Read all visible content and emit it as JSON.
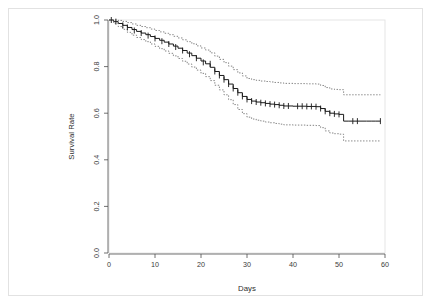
{
  "figure": {
    "kind": "kaplan-meier-survival-plot",
    "background_color": "#ffffff",
    "frame_color": "#e2e2e2",
    "axis_color": "#4d4d4d",
    "curve_color": "#1a1a1a",
    "ci_color": "#6e6e6e"
  },
  "chart_data": {
    "type": "line",
    "title": "",
    "subtitle": "",
    "xlabel": "Days",
    "ylabel": "Survival Rate",
    "xlim": [
      0,
      60
    ],
    "ylim": [
      0.0,
      1.0
    ],
    "xticks": [
      0,
      10,
      20,
      30,
      40,
      50,
      60
    ],
    "xtick_labels": [
      "0",
      "10",
      "20",
      "30",
      "40",
      "50",
      "60"
    ],
    "yticks": [
      0.0,
      0.2,
      0.4,
      0.6,
      0.8,
      1.0
    ],
    "ytick_labels": [
      "0.0",
      "0.2",
      "0.4",
      "0.6",
      "0.8",
      "1.0"
    ],
    "grid": false,
    "legend": "none",
    "step_style": "post",
    "annotations": [],
    "series": [
      {
        "name": "Survival estimate",
        "style": "solid",
        "color": "#1a1a1a",
        "x": [
          0,
          1,
          2,
          3,
          4,
          5,
          6,
          7,
          8,
          9,
          10,
          11,
          12,
          13,
          14,
          15,
          16,
          17,
          18,
          19,
          20,
          21,
          22,
          23,
          24,
          25,
          26,
          27,
          28,
          29,
          30,
          31,
          32,
          33,
          34,
          35,
          36,
          37,
          38,
          39,
          40,
          41,
          42,
          43,
          44,
          45,
          46,
          47,
          48,
          49,
          50,
          51,
          52,
          53,
          54,
          55,
          56,
          57,
          58,
          59
        ],
        "values": [
          1.0,
          0.993,
          0.985,
          0.977,
          0.968,
          0.959,
          0.951,
          0.944,
          0.937,
          0.929,
          0.921,
          0.913,
          0.905,
          0.897,
          0.888,
          0.879,
          0.869,
          0.858,
          0.847,
          0.836,
          0.824,
          0.812,
          0.797,
          0.779,
          0.762,
          0.744,
          0.725,
          0.706,
          0.688,
          0.672,
          0.659,
          0.652,
          0.648,
          0.645,
          0.642,
          0.639,
          0.637,
          0.634,
          0.631,
          0.631,
          0.63,
          0.63,
          0.63,
          0.629,
          0.629,
          0.628,
          0.62,
          0.608,
          0.6,
          0.597,
          0.595,
          0.566,
          0.566,
          0.566,
          0.566,
          0.566,
          0.566,
          0.566,
          0.566,
          0.566
        ]
      },
      {
        "name": "Upper 95% confidence limit",
        "style": "dotted",
        "color": "#6e6e6e",
        "x": [
          0,
          1,
          2,
          3,
          4,
          5,
          6,
          7,
          8,
          9,
          10,
          11,
          12,
          13,
          14,
          15,
          16,
          17,
          18,
          19,
          20,
          21,
          22,
          23,
          24,
          25,
          26,
          27,
          28,
          29,
          30,
          31,
          32,
          33,
          34,
          35,
          36,
          37,
          38,
          39,
          40,
          41,
          42,
          43,
          44,
          45,
          46,
          47,
          48,
          49,
          50,
          51,
          52,
          53,
          54,
          55,
          56,
          57,
          58,
          59
        ],
        "values": [
          1.0,
          1.0,
          0.998,
          0.994,
          0.989,
          0.983,
          0.977,
          0.972,
          0.967,
          0.961,
          0.955,
          0.949,
          0.943,
          0.937,
          0.93,
          0.923,
          0.915,
          0.907,
          0.898,
          0.889,
          0.88,
          0.871,
          0.859,
          0.845,
          0.831,
          0.817,
          0.802,
          0.787,
          0.773,
          0.76,
          0.749,
          0.744,
          0.741,
          0.738,
          0.736,
          0.734,
          0.732,
          0.73,
          0.728,
          0.728,
          0.727,
          0.727,
          0.727,
          0.726,
          0.726,
          0.725,
          0.719,
          0.71,
          0.704,
          0.702,
          0.701,
          0.679,
          0.679,
          0.679,
          0.679,
          0.679,
          0.679,
          0.679,
          0.679,
          0.679
        ]
      },
      {
        "name": "Lower 95% confidence limit",
        "style": "dotted",
        "color": "#6e6e6e",
        "x": [
          0,
          1,
          2,
          3,
          4,
          5,
          6,
          7,
          8,
          9,
          10,
          11,
          12,
          13,
          14,
          15,
          16,
          17,
          18,
          19,
          20,
          21,
          22,
          23,
          24,
          25,
          26,
          27,
          28,
          29,
          30,
          31,
          32,
          33,
          34,
          35,
          36,
          37,
          38,
          39,
          40,
          41,
          42,
          43,
          44,
          45,
          46,
          47,
          48,
          49,
          50,
          51,
          52,
          53,
          54,
          55,
          56,
          57,
          58,
          59
        ],
        "values": [
          1.0,
          0.986,
          0.972,
          0.96,
          0.947,
          0.935,
          0.925,
          0.916,
          0.907,
          0.897,
          0.887,
          0.877,
          0.867,
          0.857,
          0.846,
          0.835,
          0.823,
          0.811,
          0.798,
          0.785,
          0.771,
          0.757,
          0.74,
          0.72,
          0.7,
          0.679,
          0.658,
          0.637,
          0.616,
          0.598,
          0.583,
          0.575,
          0.57,
          0.566,
          0.562,
          0.559,
          0.556,
          0.553,
          0.55,
          0.55,
          0.549,
          0.549,
          0.549,
          0.548,
          0.548,
          0.547,
          0.538,
          0.524,
          0.515,
          0.512,
          0.51,
          0.481,
          0.481,
          0.481,
          0.481,
          0.481,
          0.481,
          0.481,
          0.481,
          0.481
        ]
      }
    ],
    "censor_marks": {
      "name": "Censoring ticks",
      "symbol": "+",
      "x": [
        0.5,
        1.5,
        3,
        4,
        5.5,
        7,
        8.5,
        10,
        11.5,
        13,
        14.5,
        16,
        17.5,
        19,
        20.5,
        22,
        23,
        24,
        25,
        26,
        27,
        28,
        29,
        30,
        31,
        32,
        33,
        34,
        35,
        36,
        37,
        38,
        39,
        41,
        42,
        43,
        44,
        45,
        46,
        47,
        48,
        49,
        50,
        53,
        54,
        59
      ],
      "values": [
        1.0,
        0.993,
        0.977,
        0.968,
        0.955,
        0.944,
        0.933,
        0.921,
        0.909,
        0.897,
        0.884,
        0.869,
        0.853,
        0.836,
        0.818,
        0.812,
        0.779,
        0.762,
        0.744,
        0.725,
        0.706,
        0.688,
        0.672,
        0.659,
        0.652,
        0.648,
        0.645,
        0.642,
        0.639,
        0.637,
        0.634,
        0.631,
        0.631,
        0.63,
        0.63,
        0.629,
        0.629,
        0.628,
        0.62,
        0.608,
        0.6,
        0.597,
        0.595,
        0.566,
        0.566,
        0.566
      ]
    }
  }
}
